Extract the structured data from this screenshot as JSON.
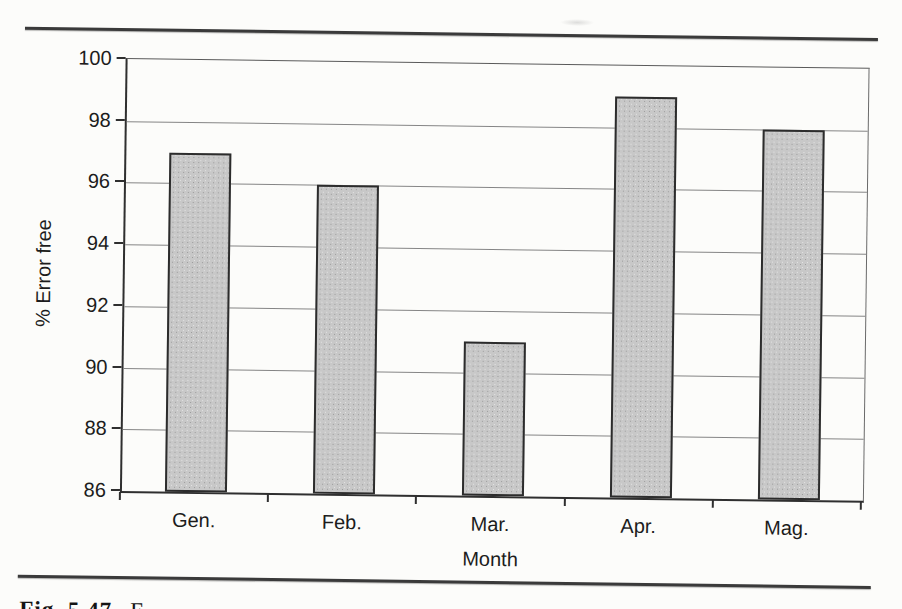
{
  "caption": {
    "prefix": "Fig. 5.47",
    "rest_partial": "E"
  },
  "chart_data": {
    "type": "bar",
    "title": "",
    "categories": [
      "Gen.",
      "Feb.",
      "Mar.",
      "Apr.",
      "Mag."
    ],
    "values": [
      97,
      96,
      91,
      99,
      98
    ],
    "xlabel": "Month",
    "ylabel": "% Error free",
    "ylim": [
      86,
      100
    ],
    "yticks": [
      86,
      88,
      90,
      92,
      94,
      96,
      98,
      100
    ],
    "grid": true,
    "legend": false,
    "bar_fill": "#c8c8c8",
    "bar_border": "#2c2c2c",
    "gridline_color": "#858585",
    "axis_color": "#2f2f2f",
    "page_rule_color": "#3a3a3a"
  }
}
